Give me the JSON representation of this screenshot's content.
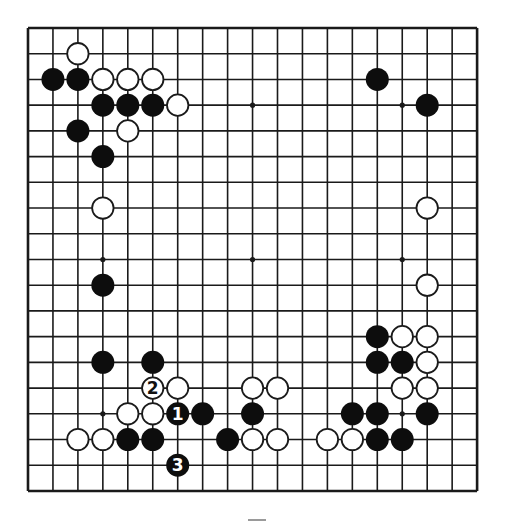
{
  "diagram": {
    "type": "go-board",
    "size": 19,
    "geometry": {
      "left": 28,
      "top": 28,
      "dx": 24.95,
      "dy": 25.72,
      "stone_radius": 11.5
    },
    "colors": {
      "line": "#1a1a1a",
      "black": "#0d0d0d",
      "white_fill": "#ffffff",
      "white_stroke": "#1a1a1a",
      "background": "#ffffff"
    },
    "star_points": [
      [
        3,
        3
      ],
      [
        9,
        3
      ],
      [
        15,
        3
      ],
      [
        3,
        9
      ],
      [
        9,
        9
      ],
      [
        15,
        9
      ],
      [
        3,
        15
      ],
      [
        9,
        15
      ],
      [
        15,
        15
      ]
    ],
    "stones": [
      {
        "color": "white",
        "col": 2,
        "row": 1
      },
      {
        "color": "black",
        "col": 1,
        "row": 2
      },
      {
        "color": "black",
        "col": 2,
        "row": 2
      },
      {
        "color": "white",
        "col": 3,
        "row": 2
      },
      {
        "color": "white",
        "col": 4,
        "row": 2
      },
      {
        "color": "white",
        "col": 5,
        "row": 2
      },
      {
        "color": "black",
        "col": 14,
        "row": 2
      },
      {
        "color": "black",
        "col": 3,
        "row": 3
      },
      {
        "color": "black",
        "col": 4,
        "row": 3
      },
      {
        "color": "black",
        "col": 5,
        "row": 3
      },
      {
        "color": "white",
        "col": 6,
        "row": 3
      },
      {
        "color": "black",
        "col": 16,
        "row": 3
      },
      {
        "color": "black",
        "col": 2,
        "row": 4
      },
      {
        "color": "white",
        "col": 4,
        "row": 4
      },
      {
        "color": "black",
        "col": 3,
        "row": 5
      },
      {
        "color": "white",
        "col": 3,
        "row": 7
      },
      {
        "color": "white",
        "col": 16,
        "row": 7
      },
      {
        "color": "black",
        "col": 3,
        "row": 10
      },
      {
        "color": "white",
        "col": 16,
        "row": 10
      },
      {
        "color": "black",
        "col": 14,
        "row": 12
      },
      {
        "color": "white",
        "col": 15,
        "row": 12
      },
      {
        "color": "white",
        "col": 16,
        "row": 12
      },
      {
        "color": "black",
        "col": 3,
        "row": 13
      },
      {
        "color": "black",
        "col": 5,
        "row": 13
      },
      {
        "color": "black",
        "col": 14,
        "row": 13
      },
      {
        "color": "black",
        "col": 15,
        "row": 13
      },
      {
        "color": "white",
        "col": 16,
        "row": 13
      },
      {
        "color": "white",
        "col": 5,
        "row": 14,
        "label": "2"
      },
      {
        "color": "white",
        "col": 6,
        "row": 14
      },
      {
        "color": "white",
        "col": 9,
        "row": 14
      },
      {
        "color": "white",
        "col": 10,
        "row": 14
      },
      {
        "color": "white",
        "col": 15,
        "row": 14
      },
      {
        "color": "white",
        "col": 16,
        "row": 14
      },
      {
        "color": "white",
        "col": 4,
        "row": 15
      },
      {
        "color": "white",
        "col": 5,
        "row": 15
      },
      {
        "color": "black",
        "col": 6,
        "row": 15,
        "label": "1"
      },
      {
        "color": "black",
        "col": 7,
        "row": 15
      },
      {
        "color": "black",
        "col": 9,
        "row": 15
      },
      {
        "color": "black",
        "col": 13,
        "row": 15
      },
      {
        "color": "black",
        "col": 14,
        "row": 15
      },
      {
        "color": "black",
        "col": 16,
        "row": 15
      },
      {
        "color": "white",
        "col": 2,
        "row": 16
      },
      {
        "color": "white",
        "col": 3,
        "row": 16
      },
      {
        "color": "black",
        "col": 4,
        "row": 16
      },
      {
        "color": "black",
        "col": 5,
        "row": 16
      },
      {
        "color": "black",
        "col": 8,
        "row": 16
      },
      {
        "color": "white",
        "col": 9,
        "row": 16
      },
      {
        "color": "white",
        "col": 10,
        "row": 16
      },
      {
        "color": "white",
        "col": 12,
        "row": 16
      },
      {
        "color": "white",
        "col": 13,
        "row": 16
      },
      {
        "color": "black",
        "col": 14,
        "row": 16
      },
      {
        "color": "black",
        "col": 15,
        "row": 16
      },
      {
        "color": "black",
        "col": 6,
        "row": 17,
        "label": "3"
      }
    ],
    "move_sequence": [
      {
        "move": "1",
        "color": "black",
        "col": 6,
        "row": 15
      },
      {
        "move": "2",
        "color": "white",
        "col": 5,
        "row": 14
      },
      {
        "move": "3",
        "color": "black",
        "col": 6,
        "row": 17
      }
    ]
  }
}
